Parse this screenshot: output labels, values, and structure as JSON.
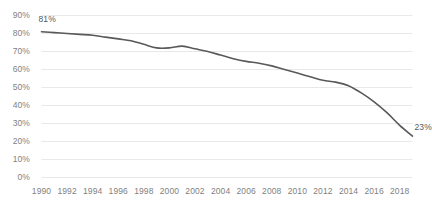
{
  "chart_data": {
    "type": "line",
    "title": "",
    "subtitle": "",
    "xlabel": "",
    "ylabel": "",
    "grid": true,
    "legend": false,
    "legend_position": "none",
    "xlim": [
      1990,
      2019
    ],
    "ylim": [
      0,
      90
    ],
    "ytick_labels": [
      "90%",
      "80%",
      "70%",
      "60%",
      "50%",
      "40%",
      "30%",
      "20%",
      "10%",
      "0%"
    ],
    "ytick_values": [
      90,
      80,
      70,
      60,
      50,
      40,
      30,
      20,
      10,
      0
    ],
    "xtick_labels": [
      "1990",
      "1992",
      "1994",
      "1996",
      "1998",
      "2000",
      "2002",
      "2004",
      "2006",
      "2008",
      "2010",
      "2012",
      "2014",
      "2016",
      "2018"
    ],
    "xtick_values": [
      1990,
      1992,
      1994,
      1996,
      1998,
      2000,
      2002,
      2004,
      2006,
      2008,
      2010,
      2012,
      2014,
      2016,
      2018
    ],
    "x": [
      1990,
      1991,
      1992,
      1993,
      1994,
      1995,
      1996,
      1997,
      1998,
      1999,
      2000,
      2001,
      2002,
      2003,
      2004,
      2005,
      2006,
      2007,
      2008,
      2009,
      2010,
      2011,
      2012,
      2013,
      2014,
      2015,
      2016,
      2017,
      2018,
      2019
    ],
    "values": [
      81,
      80.5,
      80,
      79.5,
      79,
      78,
      77,
      76,
      74,
      72,
      72,
      73,
      71.5,
      70,
      68,
      66,
      64.5,
      63.5,
      62,
      60,
      58,
      56,
      54,
      53,
      51,
      47,
      42,
      36,
      29,
      23
    ],
    "series": [
      {
        "name": "",
        "color": "#595959",
        "values": [
          81,
          80.5,
          80,
          79.5,
          79,
          78,
          77,
          76,
          74,
          72,
          72,
          73,
          71.5,
          70,
          68,
          66,
          64.5,
          63.5,
          62,
          60,
          58,
          56,
          54,
          53,
          51,
          47,
          42,
          36,
          29,
          23
        ]
      }
    ],
    "annotations": [
      {
        "name": "first-point-label",
        "text": "81%",
        "x": 1990,
        "y": 81
      },
      {
        "name": "last-point-label",
        "text": "23%",
        "x": 2019,
        "y": 23
      }
    ],
    "colors": {
      "line": "#595959",
      "gridline": "#e8e8e8",
      "tick_text": "#7f7f7f",
      "label_text": "#595959",
      "background": "#ffffff"
    }
  }
}
